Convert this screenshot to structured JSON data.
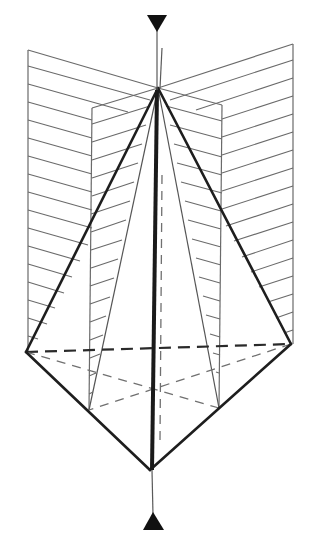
{
  "figure": {
    "colors": {
      "line": "#1e1e1e",
      "hatch": "#6a6a6a",
      "background": "#ffffff"
    },
    "axis": {
      "top_marker": "triangle-down-icon",
      "bottom_marker": "triangle-up-icon"
    },
    "vertices": {
      "apex_top": [
        158,
        88
      ],
      "apex_bottom": [
        150,
        470
      ],
      "left": [
        26,
        352
      ],
      "right": [
        291,
        344
      ],
      "back_left": [
        89,
        410
      ],
      "back_right": [
        219,
        408
      ]
    },
    "planes": [
      {
        "name": "left-plane",
        "outer_x": 28,
        "inner_x": 92
      },
      {
        "name": "right-plane",
        "outer_x": 293,
        "inner_x": 222
      }
    ]
  }
}
